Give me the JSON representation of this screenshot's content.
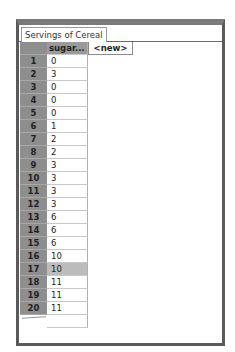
{
  "table": {
    "title": "Servings of Cereal",
    "columns": [
      "sugar...",
      "<new>"
    ],
    "rows": [
      {
        "index": "1",
        "value": "0"
      },
      {
        "index": "2",
        "value": "3"
      },
      {
        "index": "3",
        "value": "0"
      },
      {
        "index": "4",
        "value": "0"
      },
      {
        "index": "5",
        "value": "0"
      },
      {
        "index": "6",
        "value": "1"
      },
      {
        "index": "7",
        "value": "2"
      },
      {
        "index": "8",
        "value": "2"
      },
      {
        "index": "9",
        "value": "3"
      },
      {
        "index": "10",
        "value": "3"
      },
      {
        "index": "11",
        "value": "3"
      },
      {
        "index": "12",
        "value": "3"
      },
      {
        "index": "13",
        "value": "6"
      },
      {
        "index": "14",
        "value": "6"
      },
      {
        "index": "15",
        "value": "6"
      },
      {
        "index": "16",
        "value": "10"
      },
      {
        "index": "17",
        "value": "10"
      },
      {
        "index": "18",
        "value": "11"
      },
      {
        "index": "19",
        "value": "11"
      },
      {
        "index": "20",
        "value": "11"
      }
    ],
    "selected_row": "17"
  },
  "colors": {
    "frame": "#5a5a5a",
    "index_bg": "#8e8e8e",
    "selected_bg": "#bcbcbc"
  }
}
